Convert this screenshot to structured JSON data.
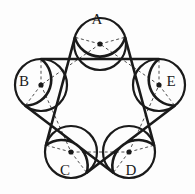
{
  "figure": {
    "background_color": "#fdfdfd",
    "stroke_color": "#1a1a1a",
    "thin_arc_color": "#8d8d8d",
    "dashed_color": "#3a3a3a",
    "belt_width": 2.6,
    "circle_width": 2.2,
    "thin_width": 0.9,
    "dash_width": 0.9,
    "dash_pattern": "3,2.6",
    "circle_radius": 26,
    "center_dot_radius": 2.6,
    "labels": [
      {
        "id": "A",
        "text": "A",
        "x": 97,
        "y": 152,
        "label_x": 97,
        "label_y": 21
      },
      {
        "id": "B",
        "text": "B",
        "x": 40,
        "y": 111,
        "label_x": 24,
        "label_y": 83
      },
      {
        "id": "C",
        "text": "C",
        "x": 62,
        "y": 44,
        "label_x": 65,
        "label_y": 172
      },
      {
        "id": "D",
        "text": "D",
        "x": 132,
        "y": 44,
        "label_x": 131,
        "label_y": 172
      },
      {
        "id": "E",
        "text": "E",
        "x": 154,
        "y": 111,
        "label_x": 171,
        "label_y": 83
      }
    ],
    "circles": [
      {
        "id": "A",
        "cx": 100,
        "cy": 44,
        "r": 26
      },
      {
        "id": "B",
        "cx": 41,
        "cy": 85,
        "r": 26
      },
      {
        "id": "C",
        "cx": 71,
        "cy": 152,
        "r": 26
      },
      {
        "id": "D",
        "cx": 129,
        "cy": 152,
        "r": 26
      },
      {
        "id": "E",
        "cx": 159,
        "cy": 85,
        "r": 26
      }
    ],
    "pentagon_dashed_edges": [
      [
        "A",
        "B"
      ],
      [
        "B",
        "C"
      ],
      [
        "C",
        "D"
      ],
      [
        "D",
        "E"
      ],
      [
        "E",
        "A"
      ]
    ],
    "belt_order": [
      "A",
      "C",
      "E",
      "B",
      "D"
    ]
  }
}
